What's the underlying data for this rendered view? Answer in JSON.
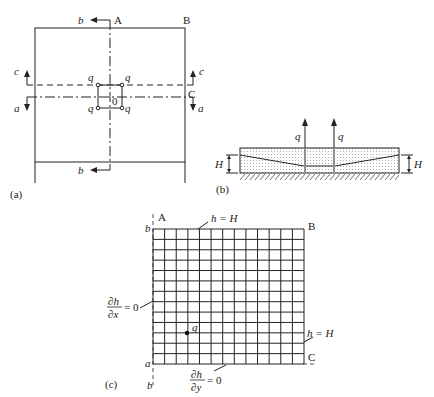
{
  "panels": {
    "a": {
      "caption": "(a)",
      "corner_labels": {
        "A": "A",
        "B": "B",
        "C": "C"
      },
      "section_labels": {
        "b_top": "b",
        "b_bottom": "b",
        "c_left": "c",
        "c_right": "c",
        "a_left": "a",
        "a_right": "a"
      },
      "well_labels": [
        "q",
        "q",
        "q",
        "q"
      ],
      "origin_label": "0"
    },
    "b": {
      "caption": "(b)",
      "well_labels": [
        "q",
        "q"
      ],
      "height_labels": [
        "H",
        "H"
      ]
    },
    "c": {
      "caption": "(c)",
      "corner_labels": {
        "A": "A",
        "B": "B",
        "C": "C"
      },
      "axis_labels": {
        "b_top": "b",
        "b_bottom": "b",
        "a": "a"
      },
      "boundary_top": "h = H",
      "boundary_right": "h = H",
      "boundary_left_num": "∂h",
      "boundary_left_den": "∂x",
      "boundary_left_eq": "= 0",
      "boundary_bottom_num": "∂h",
      "boundary_bottom_den": "∂y",
      "boundary_bottom_eq": "= 0",
      "well_label": "q",
      "grid": {
        "columns": 13,
        "rows": 13
      }
    }
  }
}
